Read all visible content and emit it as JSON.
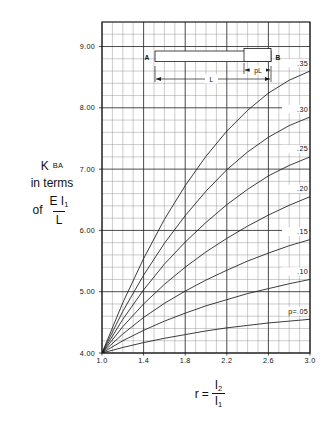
{
  "chart_data": {
    "type": "line",
    "title": "",
    "xlabel": "r = I2 / I1",
    "ylabel": "K_BA in terms of E I1 / L",
    "xlim": [
      1.0,
      3.0
    ],
    "ylim": [
      4.0,
      9.4
    ],
    "grid": true,
    "x_ticks": [
      "1.0",
      "1.4",
      "1.8",
      "2.2",
      "2.6",
      "3.0"
    ],
    "x_tick_values": [
      1.0,
      1.4,
      1.8,
      2.2,
      2.6,
      3.0
    ],
    "y_ticks": [
      "4.00",
      "5.00",
      "6.00",
      "7.00",
      "8.00",
      "9.00"
    ],
    "y_tick_values": [
      4.0,
      5.0,
      6.0,
      7.0,
      8.0,
      9.0
    ],
    "minor_grid_x_step": 0.1,
    "minor_grid_y_step": 0.2,
    "legend_position": "curve-end-labels",
    "x": [
      1.0,
      1.2,
      1.4,
      1.6,
      1.8,
      2.0,
      2.2,
      2.4,
      2.6,
      2.8,
      3.0
    ],
    "series": [
      {
        "name": "p=.05",
        "label": "p=.05",
        "values": [
          4.0,
          4.09,
          4.17,
          4.24,
          4.3,
          4.36,
          4.41,
          4.45,
          4.49,
          4.52,
          4.55
        ]
      },
      {
        "name": ".10",
        "label": ".10",
        "values": [
          4.0,
          4.2,
          4.37,
          4.52,
          4.65,
          4.77,
          4.87,
          4.97,
          5.05,
          5.13,
          5.2
        ]
      },
      {
        "name": ".15",
        "label": ".15",
        "values": [
          4.0,
          4.31,
          4.58,
          4.81,
          5.01,
          5.19,
          5.35,
          5.5,
          5.63,
          5.75,
          5.85
        ]
      },
      {
        "name": ".20",
        "label": ".20",
        "values": [
          4.0,
          4.43,
          4.8,
          5.12,
          5.4,
          5.65,
          5.87,
          6.07,
          6.25,
          6.41,
          6.55
        ]
      },
      {
        "name": ".25",
        "label": ".25",
        "values": [
          4.0,
          4.55,
          5.03,
          5.45,
          5.81,
          6.13,
          6.42,
          6.67,
          6.89,
          7.06,
          7.2
        ]
      },
      {
        "name": ".30",
        "label": ".30",
        "values": [
          4.0,
          4.68,
          5.27,
          5.79,
          6.24,
          6.64,
          6.99,
          7.28,
          7.52,
          7.71,
          7.85
        ]
      },
      {
        "name": ".35",
        "label": ".35",
        "values": [
          4.0,
          4.82,
          5.54,
          6.18,
          6.73,
          7.21,
          7.62,
          7.96,
          8.24,
          8.45,
          8.6
        ]
      }
    ]
  },
  "y_axis_title": {
    "line1": "K",
    "line1_sub": "BA",
    "line2": "in terms",
    "line3_prefix": "of",
    "frac_num": "E I",
    "frac_num_sub": "1",
    "frac_den": "L"
  },
  "x_axis_title": {
    "prefix": "r",
    "equals": "=",
    "frac_num": "I",
    "frac_num_sub": "2",
    "frac_den": "I",
    "frac_den_sub": "1"
  },
  "beam_diagram": {
    "left_support_label": "A",
    "right_support_label": "B",
    "span_label": "L",
    "haunch_label": "pL"
  }
}
